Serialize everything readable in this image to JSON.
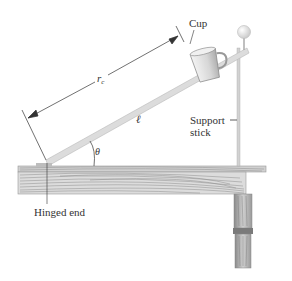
{
  "diagram": {
    "type": "physics-inclined-board",
    "labels": {
      "cup": "Cup",
      "rc": "r",
      "rc_sub": "c",
      "length": "ℓ",
      "angle": "θ",
      "support_line1": "Support",
      "support_line2": "stick",
      "hinged": "Hinged end"
    },
    "colors": {
      "board": "#dcdcdc",
      "board_edge": "#bdbdbd",
      "wood_light": "#e8e8e8",
      "wood_dark": "#9a9a9a",
      "line": "#333333",
      "text": "#333333"
    }
  }
}
